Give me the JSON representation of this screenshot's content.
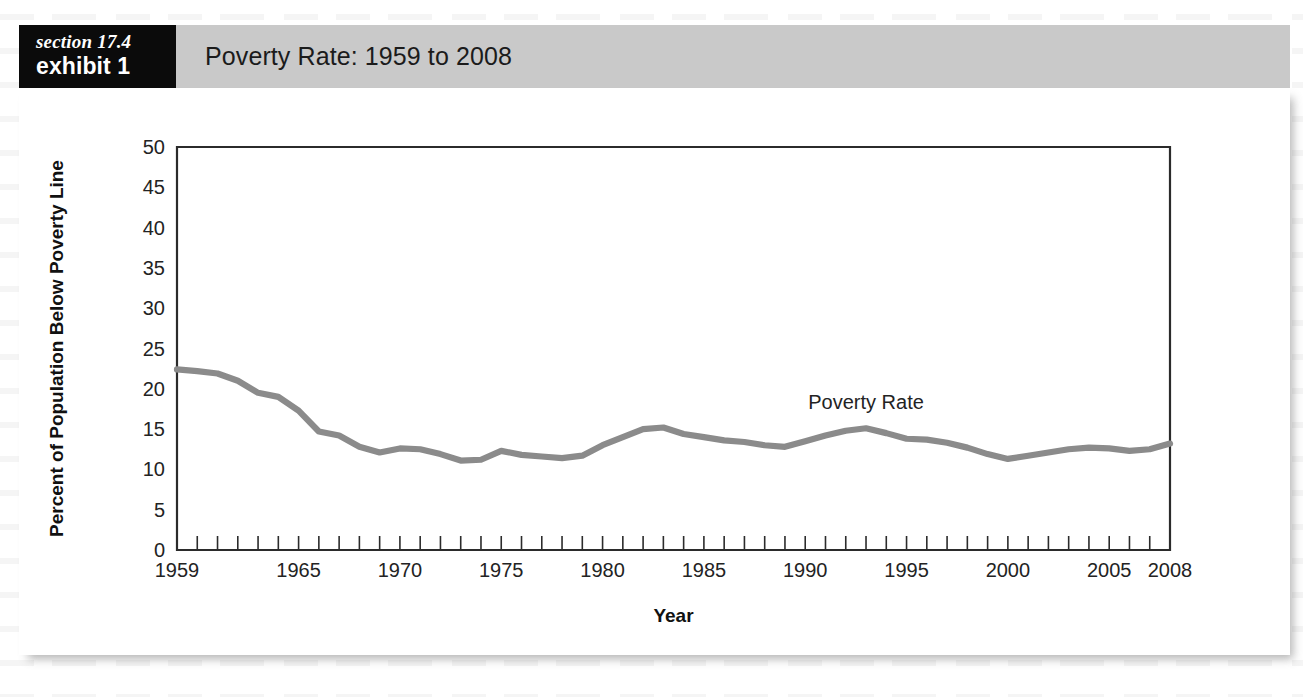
{
  "header": {
    "section_label": "section 17.4",
    "exhibit_label": "exhibit 1",
    "title": "Poverty Rate: 1959 to 2008",
    "badge_bg": "#0b0b0b",
    "band_bg": "#c9c9c9"
  },
  "chart_data": {
    "type": "line",
    "title": "Poverty Rate: 1959 to 2008",
    "xlabel": "Year",
    "ylabel": "Percent of Population Below Poverty Line",
    "xlim": [
      1959,
      2008
    ],
    "ylim": [
      0,
      50
    ],
    "yticks": [
      0,
      5,
      10,
      15,
      20,
      25,
      30,
      35,
      40,
      45,
      50
    ],
    "ytick_labels": [
      "0",
      "5",
      "10",
      "15",
      "20",
      "25",
      "30",
      "35",
      "40",
      "45",
      "50"
    ],
    "xtick_labels": [
      "1959",
      "1965",
      "1970",
      "1975",
      "1980",
      "1985",
      "1990",
      "1995",
      "2000",
      "2005",
      "2008"
    ],
    "xtick_label_years": [
      1959,
      1965,
      1970,
      1975,
      1980,
      1985,
      1990,
      1995,
      2000,
      2005,
      2008
    ],
    "x_minor_tick_step": 1,
    "grid": false,
    "legend": "none",
    "line_color": "#8b8b8b",
    "annotations": [
      {
        "text": "Poverty Rate",
        "x": 1993,
        "y": 17.5
      }
    ],
    "series": [
      {
        "name": "Poverty Rate",
        "x": [
          1959,
          1960,
          1961,
          1962,
          1963,
          1964,
          1965,
          1966,
          1967,
          1968,
          1969,
          1970,
          1971,
          1972,
          1973,
          1974,
          1975,
          1976,
          1977,
          1978,
          1979,
          1980,
          1981,
          1982,
          1983,
          1984,
          1985,
          1986,
          1987,
          1988,
          1989,
          1990,
          1991,
          1992,
          1993,
          1994,
          1995,
          1996,
          1997,
          1998,
          1999,
          2000,
          2001,
          2002,
          2003,
          2004,
          2005,
          2006,
          2007,
          2008
        ],
        "values": [
          22.4,
          22.2,
          21.9,
          21.0,
          19.5,
          19.0,
          17.3,
          14.7,
          14.2,
          12.8,
          12.1,
          12.6,
          12.5,
          11.9,
          11.1,
          11.2,
          12.3,
          11.8,
          11.6,
          11.4,
          11.7,
          13.0,
          14.0,
          15.0,
          15.2,
          14.4,
          14.0,
          13.6,
          13.4,
          13.0,
          12.8,
          13.5,
          14.2,
          14.8,
          15.1,
          14.5,
          13.8,
          13.7,
          13.3,
          12.7,
          11.9,
          11.3,
          11.7,
          12.1,
          12.5,
          12.7,
          12.6,
          12.3,
          12.5,
          13.2
        ]
      }
    ]
  }
}
